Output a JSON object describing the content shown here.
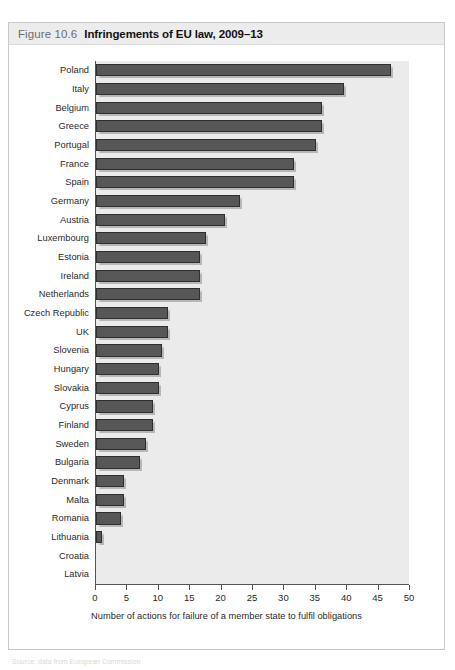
{
  "figure": {
    "number": "Figure 10.6",
    "title": "Infringements of EU law, 2009–13"
  },
  "footer_note": "Source: data from European Commission",
  "colors": {
    "bar_fill": "#575757",
    "bar_border": "#2f2f2f",
    "plot_background": "#ebebeb",
    "header_band": "#ececec",
    "axis": "#555555",
    "frame_border": "#c9c9c9"
  },
  "chart_data": {
    "type": "bar",
    "orientation": "horizontal",
    "title": "Infringements of EU law, 2009–13",
    "xlabel": "Number of actions for failure of a member state to fulfil obligations",
    "ylabel": "",
    "xlim": [
      0,
      50
    ],
    "xticks": [
      0,
      5,
      10,
      15,
      20,
      25,
      30,
      35,
      40,
      45,
      50
    ],
    "grid": false,
    "legend": null,
    "categories": [
      "Poland",
      "Italy",
      "Belgium",
      "Greece",
      "Portugal",
      "France",
      "Spain",
      "Germany",
      "Austria",
      "Luxembourg",
      "Estonia",
      "Ireland",
      "Netherlands",
      "Czech Republic",
      "UK",
      "Slovenia",
      "Hungary",
      "Slovakia",
      "Cyprus",
      "Finland",
      "Sweden",
      "Bulgaria",
      "Denmark",
      "Malta",
      "Romania",
      "Lithuania",
      "Croatia",
      "Latvia"
    ],
    "values": [
      47,
      39.5,
      36,
      36,
      35,
      31.5,
      31.5,
      23,
      20.5,
      17.5,
      16.5,
      16.5,
      16.5,
      11.5,
      11.5,
      10.5,
      10,
      10,
      9,
      9,
      8,
      7,
      4.5,
      4.5,
      4,
      1,
      0,
      0
    ]
  }
}
